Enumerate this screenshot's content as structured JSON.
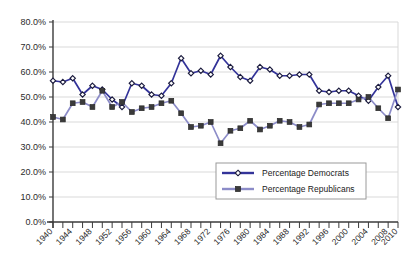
{
  "chart_data": {
    "type": "line",
    "title": "",
    "xlabel": "",
    "ylabel": "",
    "ylim": [
      0,
      80
    ],
    "ytick_values": [
      0,
      10,
      20,
      30,
      40,
      50,
      60,
      70,
      80
    ],
    "ytick_labels": [
      "0.0%",
      "10.0%",
      "20.0%",
      "30.0%",
      "40.0%",
      "50.0%",
      "60.0%",
      "70.0%",
      "80.0%"
    ],
    "xlim": [
      1940,
      2010
    ],
    "x": [
      1940,
      1942,
      1944,
      1946,
      1948,
      1950,
      1952,
      1954,
      1956,
      1958,
      1960,
      1962,
      1964,
      1966,
      1968,
      1970,
      1972,
      1974,
      1976,
      1978,
      1980,
      1982,
      1984,
      1986,
      1988,
      1990,
      1992,
      1994,
      1996,
      1998,
      2000,
      2002,
      2004,
      2006,
      2008,
      2010
    ],
    "xtick_labels": [
      "1940",
      "1944",
      "1948",
      "1952",
      "1956",
      "1960",
      "1964",
      "1968",
      "1972",
      "1976",
      "1980",
      "1984",
      "1988",
      "1992",
      "1996",
      "2000",
      "2004",
      "2008",
      "2010"
    ],
    "xtick_label_years": [
      1940,
      1944,
      1948,
      1952,
      1956,
      1960,
      1964,
      1968,
      1972,
      1976,
      1980,
      1984,
      1988,
      1992,
      1996,
      2000,
      2004,
      2008,
      2010
    ],
    "minor_tick_interval": 2,
    "grid": true,
    "legend_position": "lower-right",
    "series": [
      {
        "name": "Percentage Democrats",
        "color": "#333399",
        "marker": "diamond",
        "values": [
          56.5,
          56.0,
          57.5,
          51.0,
          54.5,
          53.0,
          49.0,
          46.0,
          55.5,
          54.5,
          51.0,
          50.5,
          55.5,
          65.5,
          59.5,
          60.5,
          59.0,
          66.5,
          62.0,
          58.0,
          56.5,
          62.0,
          61.0,
          58.5,
          58.5,
          59.0,
          59.0,
          52.5,
          52.0,
          52.5,
          52.5,
          50.5,
          48.5,
          54.0,
          58.5,
          46.0
        ]
      },
      {
        "name": "Percentage Republicans",
        "color": "#8c8cc8",
        "marker": "square",
        "values": [
          42.0,
          41.0,
          47.5,
          48.0,
          46.0,
          52.5,
          46.0,
          48.0,
          44.0,
          45.5,
          46.0,
          47.5,
          48.5,
          43.5,
          38.0,
          38.5,
          40.0,
          31.5,
          36.5,
          37.5,
          40.5,
          37.0,
          38.5,
          40.5,
          40.0,
          38.0,
          39.0,
          47.0,
          47.5,
          47.5,
          47.5,
          49.0,
          50.0,
          45.5,
          41.5,
          53.0
        ]
      }
    ]
  },
  "legend": {
    "entries": [
      {
        "label": "Percentage Democrats",
        "color": "#333399",
        "marker": "diamond"
      },
      {
        "label": "Percentage Republicans",
        "color": "#8c8cc8",
        "marker": "square"
      }
    ]
  },
  "footer": {
    "cutoff_text": ""
  }
}
